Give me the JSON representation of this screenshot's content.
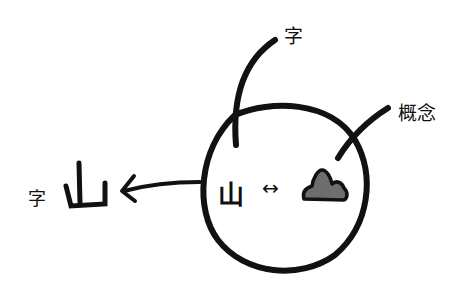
{
  "diagram": {
    "labels": {
      "top_pointer": "字",
      "right_pointer": "概念",
      "left_prefix": "字",
      "left_big_char": "山",
      "inner_char": "山",
      "inner_arrow": "↔"
    },
    "colors": {
      "stroke": "#111111",
      "mountain_fill": "#6e6e6e",
      "background": "#ffffff"
    }
  }
}
